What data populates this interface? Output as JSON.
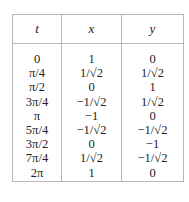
{
  "table": {
    "headers": [
      "t",
      "x",
      "y"
    ],
    "rows": [
      [
        "0",
        "1",
        "0"
      ],
      [
        "π/4",
        "1/√2",
        "1/√2"
      ],
      [
        "π/2",
        "0",
        "1"
      ],
      [
        "3π/4",
        "−1/√2",
        "1/√2"
      ],
      [
        "π",
        "−1",
        "0"
      ],
      [
        "5π/4",
        "−1/√2",
        "−1/√2"
      ],
      [
        "3π/2",
        "0",
        "−1"
      ],
      [
        "7π/4",
        "1/√2",
        "−1/√2"
      ],
      [
        "2π",
        "1",
        "0"
      ]
    ]
  }
}
